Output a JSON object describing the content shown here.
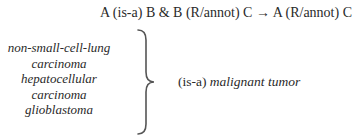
{
  "rule": {
    "text": "A (is-a) B & B (R/annot) C → A (R/annot) C"
  },
  "terms": [
    "non-small-cell-lung",
    "carcinoma",
    "hepatocellular",
    "carcinoma",
    "glioblastoma"
  ],
  "brace": {
    "icon": "right-curly-brace-icon"
  },
  "result": {
    "relation": "(is-a)",
    "target": "malignant tumor"
  }
}
